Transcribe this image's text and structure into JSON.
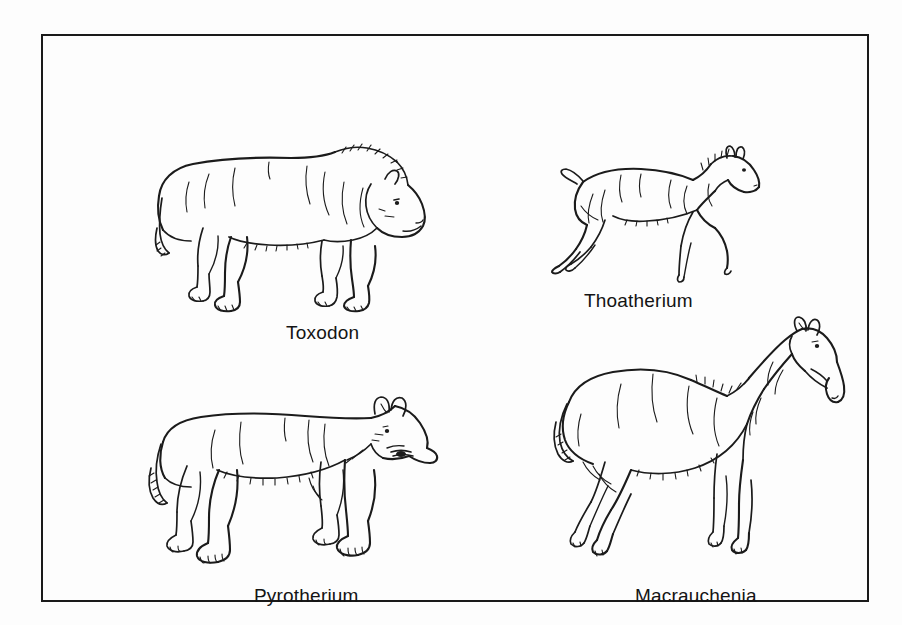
{
  "plate": {
    "background_color": "#fdfdfd",
    "border_color": "#1a1a1a",
    "line_color": "#1b1b1b",
    "title": "Extinct South American Native Ungulates"
  },
  "figures": [
    {
      "id": "toxodon",
      "label": "Toxodon",
      "description": "Large heavy-bodied rhinoceros-like quadruped walking to the right, blunt snout, short tufted tail, column-like legs",
      "position": "top-left"
    },
    {
      "id": "thoatherium",
      "label": "Thoatherium",
      "description": "Small slender horse-like animal in galloping pose, upright bristly mane, short raised tail, single-toed legs",
      "position": "top-right"
    },
    {
      "id": "pyrotherium",
      "label": "Pyrotherium",
      "description": "Heavy hippo-like body with short proboscis, tusks in open mouth, small rounded ear, broad toed feet, tufted tail",
      "position": "bottom-left"
    },
    {
      "id": "macrauchenia",
      "label": "Macrauchenia",
      "description": "Camel-like body with long neck and downward-hooked proboscis, small ears, slender three-toed legs",
      "position": "bottom-right"
    }
  ]
}
